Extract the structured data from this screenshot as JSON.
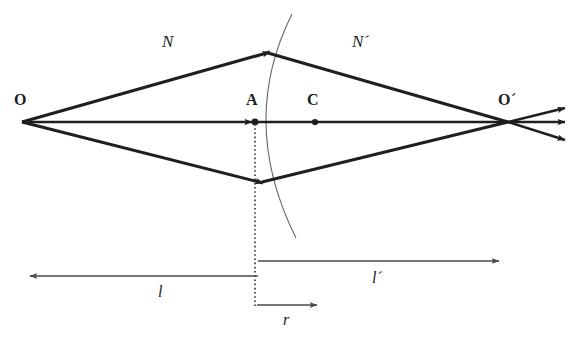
{
  "figure": {
    "background": "#ffffff",
    "stroke_color": "#1f1f1f",
    "thin_stroke_color": "#555555",
    "width": 580,
    "height": 341
  },
  "points": {
    "object": {
      "label": "O",
      "x": 22,
      "y": 122,
      "label_x": 14,
      "label_y": 92
    },
    "vertex": {
      "label": "A",
      "x": 255,
      "y": 122,
      "label_x": 246,
      "label_y": 92
    },
    "center": {
      "label": "C",
      "x": 315,
      "y": 122,
      "label_x": 307,
      "label_y": 92
    },
    "image": {
      "label": "O´",
      "x": 508,
      "y": 122,
      "label_x": 498,
      "label_y": 92
    }
  },
  "media": {
    "incident": {
      "label": "N",
      "x": 162,
      "y": 33
    },
    "refracted": {
      "label": "N´",
      "x": 352,
      "y": 33
    }
  },
  "distances": {
    "object_distance": {
      "label": "l",
      "x": 158,
      "y": 284,
      "arrow_from_x": 258,
      "arrow_to_x": 27,
      "arrow_y": 276
    },
    "image_distance": {
      "label": "l´",
      "x": 372,
      "y": 270,
      "arrow_from_x": 258,
      "arrow_to_x": 502,
      "arrow_y": 261
    },
    "radius": {
      "label": "r",
      "x": 283,
      "y": 312,
      "arrow_from_x": 257,
      "arrow_to_x": 320,
      "arrow_y": 305
    }
  },
  "rays": {
    "upper_incident": {
      "from_x": 22,
      "from_y": 122,
      "to_x": 270,
      "to_y": 52
    },
    "upper_refracted": {
      "from_x": 270,
      "from_y": 52,
      "to_x": 508,
      "to_y": 122
    },
    "axial": {
      "from_x": 22,
      "from_y": 122,
      "to_x": 508,
      "to_y": 122
    },
    "lower_incident": {
      "from_x": 22,
      "from_y": 122,
      "to_x": 263,
      "to_y": 183
    },
    "lower_refracted": {
      "from_x": 263,
      "from_y": 183,
      "to_x": 508,
      "to_y": 122
    },
    "exit_upper": {
      "from_x": 508,
      "from_y": 122,
      "to_x": 568,
      "to_y": 107
    },
    "exit_middle": {
      "from_x": 508,
      "from_y": 122,
      "to_x": 568,
      "to_y": 122
    },
    "exit_lower": {
      "from_x": 508,
      "from_y": 122,
      "to_x": 568,
      "to_y": 141
    }
  },
  "surface": {
    "name": "spherical-refracting-surface",
    "top_x": 292,
    "top_y": 14,
    "vertex_x": 255,
    "vertex_y": 122,
    "bottom_x": 296,
    "bottom_y": 238
  },
  "construction": {
    "vertical_dotted_line": {
      "x": 255,
      "from_y": 124,
      "to_y": 306
    }
  }
}
